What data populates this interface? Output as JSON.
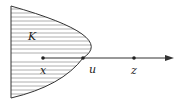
{
  "diagram": {
    "region": {
      "label": "K",
      "fill_pattern": "horizontal-hatching",
      "stroke": "#333333",
      "hatch_color": "#9a9a9a"
    },
    "points": [
      {
        "id": "x",
        "label": "x",
        "cx": 43,
        "cy": 58
      },
      {
        "id": "u",
        "label": "u",
        "cx": 83,
        "cy": 58
      },
      {
        "id": "z",
        "label": "z",
        "cx": 134,
        "cy": 58
      }
    ],
    "ray": {
      "from": "x",
      "through": "z",
      "direction": "right"
    }
  }
}
